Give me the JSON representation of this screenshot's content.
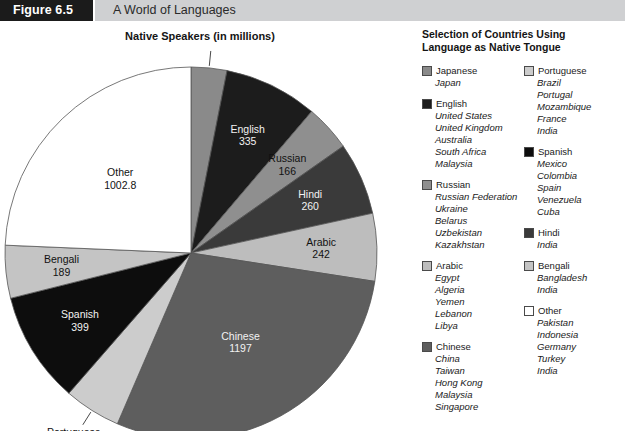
{
  "header": {
    "figure_label": "Figure 6.5",
    "banner_title": "A World of Languages"
  },
  "chart_title": "Native Speakers (in millions)",
  "legend": {
    "title": "Selection of Countries Using Language as Native Tongue",
    "columns": [
      {
        "groups": [
          {
            "language": "Japanese",
            "color": "#8a8a8a",
            "countries": [
              "Japan"
            ]
          },
          {
            "language": "English",
            "color": "#1c1c1c",
            "countries": [
              "United States",
              "United Kingdom",
              "Australia",
              "South Africa",
              "Malaysia"
            ]
          },
          {
            "language": "Russian",
            "color": "#8f8f8f",
            "countries": [
              "Russian Federation",
              "Ukraine",
              "Belarus",
              "Uzbekistan",
              "Kazakhstan"
            ]
          },
          {
            "language": "Arabic",
            "color": "#bdbdbd",
            "countries": [
              "Egypt",
              "Algeria",
              "Yemen",
              "Lebanon",
              "Libya"
            ]
          },
          {
            "language": "Chinese",
            "color": "#5e5e5e",
            "countries": [
              "China",
              "Taiwan",
              "Hong Kong",
              "Malaysia",
              "Singapore"
            ]
          }
        ]
      },
      {
        "groups": [
          {
            "language": "Portuguese",
            "color": "#cccccc",
            "countries": [
              "Brazil",
              "Portugal",
              "Mozambique",
              "France",
              "India"
            ]
          },
          {
            "language": "Spanish",
            "color": "#0d0d0d",
            "countries": [
              "Mexico",
              "Colombia",
              "Spain",
              "Venezuela",
              "Cuba"
            ]
          },
          {
            "language": "Hindi",
            "color": "#3a3a3a",
            "countries": [
              "India"
            ]
          },
          {
            "language": "Bengali",
            "color": "#c4c4c4",
            "countries": [
              "Bangladesh",
              "India"
            ]
          },
          {
            "language": "Other",
            "color": "#ffffff",
            "countries": [
              "Pakistan",
              "Indonesia",
              "Germany",
              "Turkey",
              "India"
            ]
          }
        ]
      }
    ]
  },
  "chart_data": {
    "type": "pie",
    "title": "Native Speakers (in millions)",
    "unit": "millions of native speakers",
    "start_angle_deg": 0,
    "direction": "clockwise",
    "categories": [
      "Japanese",
      "English",
      "Russian",
      "Hindi",
      "Arabic",
      "Chinese",
      "Portuguese",
      "Spanish",
      "Bengali",
      "Other"
    ],
    "values": [
      128,
      335,
      166,
      260,
      242,
      1197,
      203,
      399,
      189,
      1002.8
    ],
    "labels": [
      {
        "name": "Japanese",
        "value": 128,
        "display": "128",
        "color": "#8a8a8a",
        "label_outside": true
      },
      {
        "name": "English",
        "value": 335,
        "display": "335",
        "color": "#1c1c1c",
        "label_outside": false
      },
      {
        "name": "Russian",
        "value": 166,
        "display": "166",
        "color": "#8f8f8f",
        "label_outside": false
      },
      {
        "name": "Hindi",
        "value": 260,
        "display": "260",
        "color": "#3a3a3a",
        "label_outside": false
      },
      {
        "name": "Arabic",
        "value": 242,
        "display": "242",
        "color": "#bdbdbd",
        "label_outside": false
      },
      {
        "name": "Chinese",
        "value": 1197,
        "display": "1197",
        "color": "#5e5e5e",
        "label_outside": false
      },
      {
        "name": "Portuguese",
        "value": 203,
        "display": "203",
        "color": "#cccccc",
        "label_outside": true
      },
      {
        "name": "Spanish",
        "value": 399,
        "display": "399",
        "color": "#0d0d0d",
        "label_outside": false
      },
      {
        "name": "Bengali",
        "value": 189,
        "display": "189",
        "color": "#c4c4c4",
        "label_outside": false
      },
      {
        "name": "Other",
        "value": 1002.8,
        "display": "1002.8",
        "color": "#ffffff",
        "label_outside": false
      }
    ],
    "total": 4121.8,
    "legend_position": "right",
    "grid": false
  }
}
